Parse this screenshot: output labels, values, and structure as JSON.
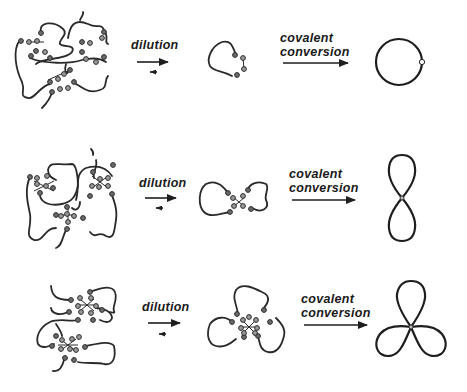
{
  "figure": {
    "rows": [
      {
        "id": "single-loop",
        "dilution_label": "dilution",
        "conversion_label_line1": "covalent",
        "conversion_label_line2": "conversion",
        "product_topology": "monocyclic-ring"
      },
      {
        "id": "two-loop",
        "dilution_label": "dilution",
        "conversion_label_line1": "covalent",
        "conversion_label_line2": "conversion",
        "product_topology": "figure-eight"
      },
      {
        "id": "three-loop",
        "dilution_label": "dilution",
        "conversion_label_line1": "covalent",
        "conversion_label_line2": "conversion",
        "product_topology": "trefoil"
      }
    ],
    "colors": {
      "line": "#1e1e1e",
      "bead": "#6b6b6b",
      "background": "#ffffff"
    }
  }
}
